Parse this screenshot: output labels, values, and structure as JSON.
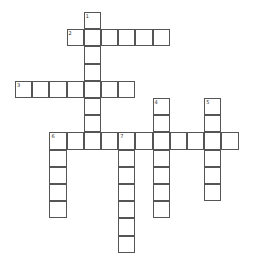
{
  "puzzle": {
    "cell_size": 17.2,
    "origin": [
      15,
      12
    ],
    "entries": [
      {
        "number": "1",
        "direction": "down",
        "row": 0,
        "col": 4,
        "length": 8
      },
      {
        "number": "2",
        "direction": "across",
        "row": 1,
        "col": 3,
        "length": 6
      },
      {
        "number": "3",
        "direction": "across",
        "row": 4,
        "col": 0,
        "length": 7
      },
      {
        "number": "4",
        "direction": "down",
        "row": 5,
        "col": 8,
        "length": 7
      },
      {
        "number": "5",
        "direction": "down",
        "row": 5,
        "col": 11,
        "length": 6
      },
      {
        "number": "6",
        "direction": "across",
        "row": 7,
        "col": 2,
        "length": 11
      },
      {
        "number": "6",
        "direction": "down",
        "row": 7,
        "col": 2,
        "length": 5
      },
      {
        "number": "7",
        "direction": "down",
        "row": 7,
        "col": 6,
        "length": 7
      }
    ]
  }
}
